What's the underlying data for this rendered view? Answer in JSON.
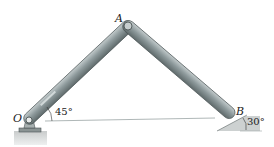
{
  "diagram": {
    "points": {
      "O": {
        "label": "O",
        "x": 29,
        "y": 119
      },
      "A": {
        "label": "A",
        "x": 128,
        "y": 26
      },
      "B": {
        "label": "B",
        "x": 234,
        "y": 117
      }
    },
    "angles": {
      "at_O": "45°",
      "at_B": "30°"
    },
    "colors": {
      "link": "#7d8a8c",
      "link_highlight": "#b9c2c3",
      "link_outline": "#4a5354",
      "support": "#c8cccc",
      "ground": "#d6d8d8",
      "baseline": "#8a9696"
    }
  }
}
